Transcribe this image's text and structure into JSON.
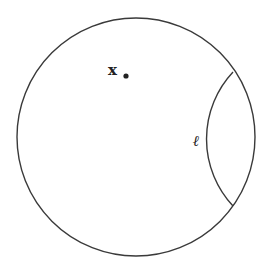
{
  "diagram": {
    "labels": {
      "point": "x",
      "line": "ℓ"
    },
    "colors": {
      "stroke": "#3a3a3a",
      "text": "#222222",
      "background": "#ffffff"
    },
    "disk": {
      "cx": 136,
      "cy": 137,
      "r": 119
    },
    "point": {
      "x": 126,
      "y": 76
    },
    "geodesic": {
      "start": [
        233,
        72
      ],
      "end": [
        233,
        206
      ],
      "arc_radius": 98
    }
  }
}
